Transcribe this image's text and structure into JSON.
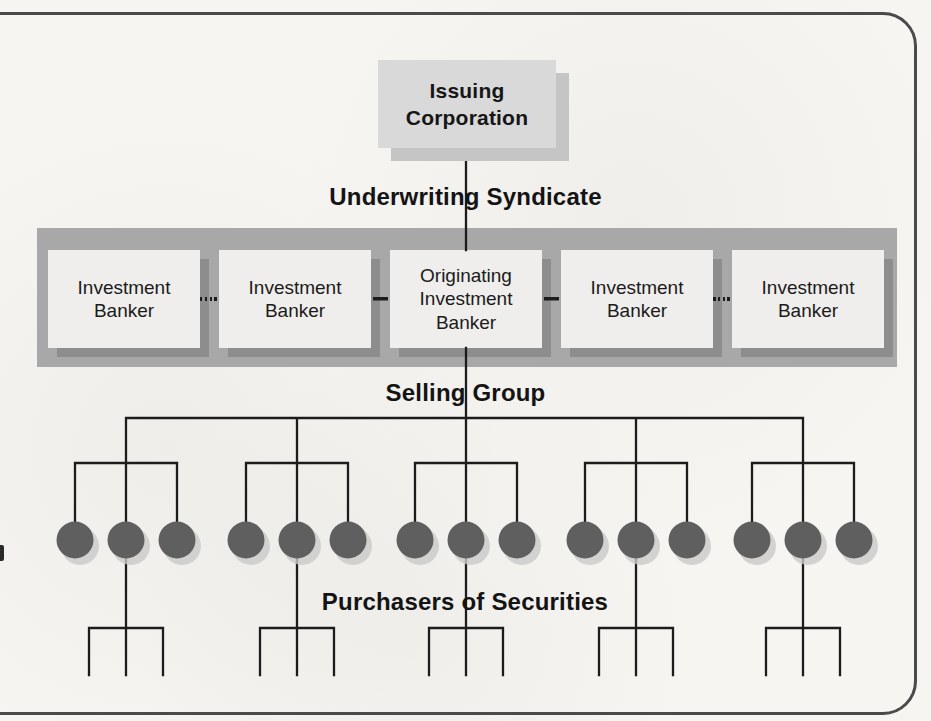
{
  "figure": {
    "issuer": {
      "label": "Issuing\nCorporation"
    },
    "section_labels": {
      "underwriting_syndicate": "Underwriting Syndicate",
      "selling_group": "Selling Group",
      "purchasers": "Purchasers of Securities"
    },
    "syndicate": {
      "boxes": [
        {
          "label": "Investment\nBanker"
        },
        {
          "label": "Investment\nBanker"
        },
        {
          "label": "Originating\nInvestment\nBanker"
        },
        {
          "label": "Investment\nBanker"
        },
        {
          "label": "Investment\nBanker"
        }
      ],
      "connector_styles": [
        "dotted",
        "solid",
        "solid",
        "dotted"
      ]
    },
    "selling_tree": {
      "groups": 5,
      "purchasers_per_group": 3,
      "total_purchaser_nodes": 15
    },
    "colors": {
      "page": "#f7f5f1",
      "border": "#4a4a4a",
      "band": "#a8a8a8",
      "box_fill": "#efeeec",
      "box_shadow": "#8d8d8d",
      "issuer_fill": "#d9d9d9",
      "issuer_shadow": "#c5c5c5",
      "node_fill": "#5f5f5f",
      "node_shadow": "#c9c9c9",
      "line": "#1c1c1c"
    }
  }
}
